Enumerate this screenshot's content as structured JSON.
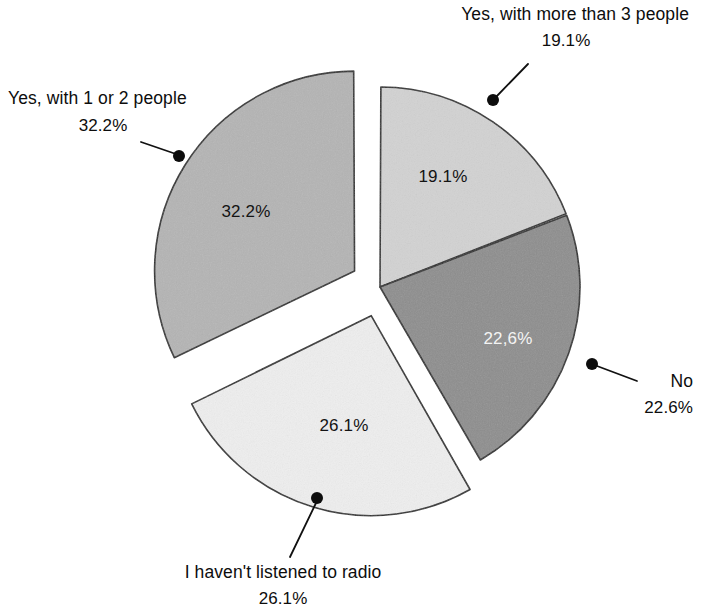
{
  "figure": {
    "background_color": "#ffffff",
    "width": 701,
    "height": 614,
    "outline_color": "#2a2a2a"
  },
  "chart_data": {
    "type": "pie",
    "title": "",
    "subtitle": "",
    "xlabel": "",
    "ylabel": "",
    "legend_position": "callouts-around-pie",
    "grid": false,
    "units": "percent",
    "start_angle_deg": 0,
    "direction": "clockwise",
    "categories": [
      "Yes, with more than 3 people",
      "No",
      "I haven't listened to radio",
      "Yes, with 1 or 2 people"
    ],
    "values": [
      19.1,
      22.6,
      26.1,
      32.2
    ],
    "slices": [
      {
        "label": "Yes, with more than 3 people",
        "value": 19.1,
        "value_text": "19.1%",
        "inner_label_text": "19.1%",
        "inner_label_color": "#131313",
        "color": "#d2d2d2",
        "exploded": false,
        "callout_position": "top-right"
      },
      {
        "label": "No",
        "value": 22.6,
        "value_text": "22.6%",
        "inner_label_text": "22,6%",
        "inner_label_color": "#f4f4f4",
        "color": "#8d8d8d",
        "exploded": false,
        "callout_position": "right"
      },
      {
        "label": "I haven't listened to radio",
        "value": 26.1,
        "value_text": "26.1%",
        "inner_label_text": "26.1%",
        "inner_label_color": "#131313",
        "color": "#eeeeee",
        "exploded": true,
        "callout_position": "bottom"
      },
      {
        "label": "Yes, with 1 or 2 people",
        "value": 32.2,
        "value_text": "32.2%",
        "inner_label_text": "32.2%",
        "inner_label_color": "#131313",
        "color": "#b4b4b4",
        "exploded": true,
        "callout_position": "top-left"
      }
    ]
  },
  "callouts": {
    "top_right": {
      "label": "Yes, with more than 3 people",
      "value_text": "19.1%"
    },
    "top_left": {
      "label": "Yes, with 1 or 2 people",
      "value_text": "32.2%"
    },
    "right": {
      "label": "No",
      "value_text": "22.6%"
    },
    "bottom": {
      "label": "I haven't listened to radio",
      "value_text": "26.1%"
    }
  },
  "inner_labels": {
    "slice_19": "19.1%",
    "slice_22": "22,6%",
    "slice_26": "26.1%",
    "slice_32": "32.2%"
  }
}
